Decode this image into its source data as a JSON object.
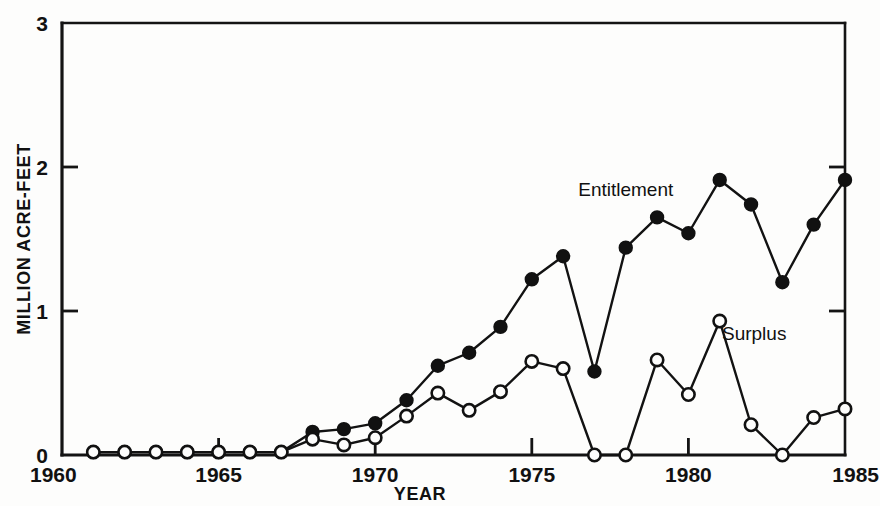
{
  "chart_data": {
    "type": "line",
    "title": "",
    "xlabel": "YEAR",
    "ylabel": "MILLION ACRE-FEET",
    "xlim": [
      1960,
      1985
    ],
    "ylim": [
      0,
      3
    ],
    "xticks": [
      1960,
      1965,
      1970,
      1975,
      1980,
      1985
    ],
    "xtick_labels": [
      "1960",
      "1965",
      "1970",
      "1975",
      "1980",
      "1985"
    ],
    "yticks": [
      0,
      1,
      2,
      3
    ],
    "ytick_labels": [
      "0",
      "1",
      "2",
      "3"
    ],
    "grid": false,
    "legend_position": "inline-annotation",
    "x": [
      1961,
      1962,
      1963,
      1964,
      1965,
      1966,
      1967,
      1968,
      1969,
      1970,
      1971,
      1972,
      1973,
      1974,
      1975,
      1976,
      1977,
      1978,
      1979,
      1980,
      1981,
      1982,
      1983,
      1984,
      1985
    ],
    "series": [
      {
        "name": "Entitlement",
        "marker": "filled-circle",
        "values": [
          0.02,
          0.02,
          0.02,
          0.02,
          0.02,
          0.02,
          0.02,
          0.16,
          0.18,
          0.22,
          0.38,
          0.62,
          0.71,
          0.89,
          1.22,
          1.38,
          0.58,
          1.44,
          1.65,
          1.54,
          1.91,
          1.74,
          1.2,
          1.6,
          1.91
        ]
      },
      {
        "name": "Surplus",
        "marker": "open-circle",
        "values": [
          0.02,
          0.02,
          0.02,
          0.02,
          0.02,
          0.02,
          0.02,
          0.11,
          0.07,
          0.12,
          0.27,
          0.43,
          0.31,
          0.44,
          0.65,
          0.6,
          0.0,
          0.0,
          0.66,
          0.42,
          0.93,
          0.21,
          0.0,
          0.26,
          0.32
        ]
      }
    ],
    "annotations": [
      {
        "text": "Entitlement",
        "x": 1978.0,
        "y": 1.8
      },
      {
        "text": "Surplus",
        "x": 1982.1,
        "y": 0.8
      }
    ]
  }
}
